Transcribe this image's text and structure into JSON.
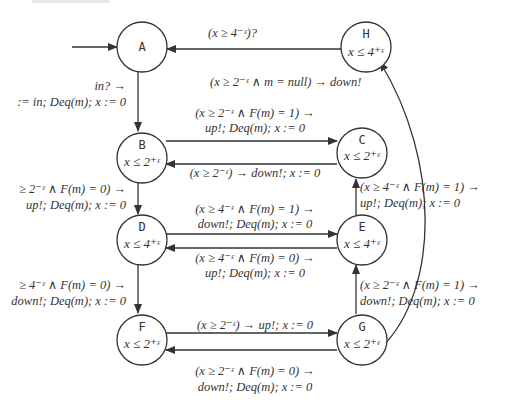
{
  "diagram": {
    "type": "timed-automaton",
    "nodes": [
      {
        "id": "A",
        "name": "A",
        "invariant": ""
      },
      {
        "id": "H",
        "name": "H",
        "invariant": "x ≤ 4⁺ᵋ"
      },
      {
        "id": "B",
        "name": "B",
        "invariant": "x ≤ 2⁺ᵋ"
      },
      {
        "id": "C",
        "name": "C",
        "invariant": "x ≤ 2⁺ᵋ"
      },
      {
        "id": "D",
        "name": "D",
        "invariant": "x ≤ 4⁺ᵋ"
      },
      {
        "id": "E",
        "name": "E",
        "invariant": "x ≤ 4⁺ᵋ"
      },
      {
        "id": "F",
        "name": "F",
        "invariant": "x ≤ 2⁺ᵋ"
      },
      {
        "id": "G",
        "name": "G",
        "invariant": "x ≤ 2⁺ᵋ"
      }
    ],
    "edges": [
      {
        "from": "start",
        "to": "A",
        "label1": "",
        "label2": ""
      },
      {
        "from": "H",
        "to": "A",
        "label1": "(x ≥ 4⁻ᵋ)?",
        "label2": ""
      },
      {
        "from": "A",
        "to": "B",
        "label1": "in? →",
        "label2": ":= in; Deq(m); x := 0"
      },
      {
        "from": "B",
        "to": "H",
        "label1": "(x ≥ 2⁻ᵋ ∧ m = null) → down!",
        "label2": ""
      },
      {
        "from": "B",
        "to": "C",
        "label1": "(x ≥ 2⁻ᵋ ∧ F(m) = 1) →",
        "label2": "up!; Deq(m); x := 0"
      },
      {
        "from": "C",
        "to": "B",
        "label1": "(x ≥ 2⁻ᵋ) → down!; x := 0",
        "label2": ""
      },
      {
        "from": "B",
        "to": "D",
        "label1": "≥ 2⁻ᵋ ∧ F(m) = 0) →",
        "label2": "up!; Deq(m); x := 0"
      },
      {
        "from": "D",
        "to": "E",
        "label1": "(x ≥ 4⁻ᵋ ∧ F(m) = 1) →",
        "label2": "down!; Deq(m); x := 0"
      },
      {
        "from": "E",
        "to": "D",
        "label1": "(x ≥ 4⁻ᵋ ∧ F(m) = 0) →",
        "label2": "up!; Deq(m); x := 0"
      },
      {
        "from": "E",
        "to": "C",
        "label1": "(x ≥ 4⁻ᵋ ∧ F(m) = 1) →",
        "label2": "up!; Deq(m); x := 0"
      },
      {
        "from": "D",
        "to": "F",
        "label1": "≥ 4⁻ᵋ ∧ F(m) = 0) →",
        "label2": "down!; Deq(m); x := 0"
      },
      {
        "from": "G",
        "to": "E",
        "label1": "(x ≥ 2⁻ᵋ ∧ F(m) = 1) →",
        "label2": "down!; Deq(m); x := 0"
      },
      {
        "from": "F",
        "to": "G",
        "label1": "(x ≥ 2⁻ᵋ) → up!; x := 0",
        "label2": ""
      },
      {
        "from": "G",
        "to": "F",
        "label1": "(x ≥ 2⁻ᵋ ∧ F(m) = 0) →",
        "label2": "down!; Deq(m); x := 0"
      },
      {
        "from": "G",
        "to": "H",
        "label1": "",
        "label2": ""
      }
    ]
  }
}
